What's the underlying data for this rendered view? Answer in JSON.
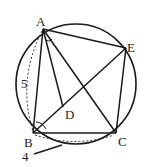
{
  "diagram": {
    "points": {
      "A": {
        "label": "A",
        "x": 43,
        "y": 29
      },
      "B": {
        "label": "B",
        "x": 33,
        "y": 133
      },
      "C": {
        "label": "C",
        "x": 116,
        "y": 133
      },
      "D": {
        "label": "D",
        "x": 63,
        "y": 107
      },
      "E": {
        "label": "E",
        "x": 126,
        "y": 48
      }
    },
    "circle": {
      "cx": 76,
      "cy": 84,
      "r": 60
    },
    "measurements": {
      "AB": "5",
      "BC": "4"
    },
    "colors": {
      "stroke": "#1a1a1a",
      "label": "#222222"
    }
  }
}
